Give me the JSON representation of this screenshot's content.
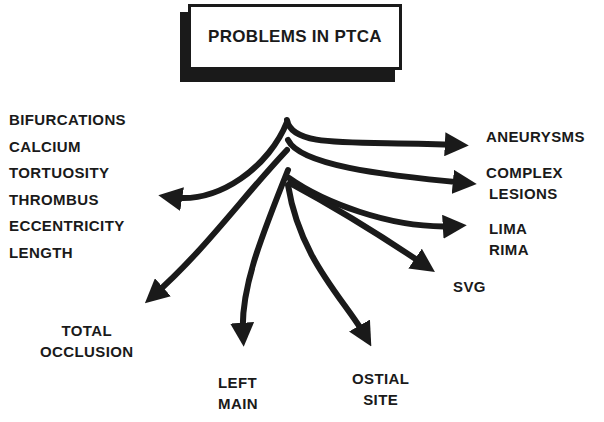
{
  "title": "PROBLEMS IN PTCA",
  "left_list": [
    "BIFURCATIONS",
    "CALCIUM",
    "TORTUOSITY",
    "THROMBUS",
    "ECCENTRICITY",
    "LENGTH"
  ],
  "branches": {
    "aneurysms": {
      "line1": "ANEURYSMS"
    },
    "complex_lesions": {
      "line1": "COMPLEX",
      "line2": "LESIONS"
    },
    "lima_rima": {
      "line1": "LIMA",
      "line2": "RIMA"
    },
    "svg": {
      "line1": "SVG"
    },
    "ostial_site": {
      "line1": "OSTIAL",
      "line2": "SITE"
    },
    "left_main": {
      "line1": "LEFT",
      "line2": "MAIN"
    },
    "total_occlusion": {
      "line1": "TOTAL",
      "line2": "OCCLUSION"
    }
  },
  "colors": {
    "ink": "#1a1a1a",
    "background": "#ffffff"
  }
}
